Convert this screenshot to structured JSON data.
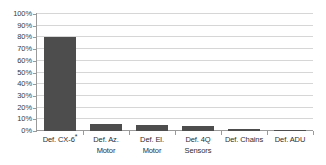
{
  "chart_data": {
    "type": "bar",
    "title": "",
    "xlabel": "",
    "ylabel": "",
    "categories": [
      "Def. CX-6*",
      "Def. Az.\nMotor",
      "Def. El.\nMotor",
      "Def. 4Q\nSensors",
      "Def. Chains",
      "Def. ADU"
    ],
    "values": [
      80,
      6,
      5,
      4,
      1.5,
      1
    ],
    "ylim": [
      0,
      100
    ],
    "ytick_labels": [
      "100%",
      "90%",
      "80%",
      "70%",
      "60%",
      "50%",
      "40%",
      "30%",
      "20%",
      "10%",
      "0%"
    ],
    "ytick_values": [
      100,
      90,
      80,
      70,
      60,
      50,
      40,
      30,
      20,
      10,
      0
    ],
    "grid": true,
    "legend": false,
    "bar_color": "#4d4d4d",
    "gridline_color": "#d6d6d6",
    "axis_color": "#9a9a9a",
    "background_color": "#ffffff"
  }
}
